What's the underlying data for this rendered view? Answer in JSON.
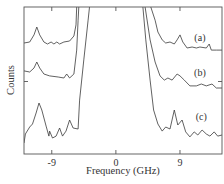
{
  "chart_data": {
    "type": "line",
    "title": "",
    "xlabel": "Frequency (GHz)",
    "ylabel": "Counts",
    "xlim": [
      -12.9,
      14.9
    ],
    "ylim": [
      0,
      100
    ],
    "xticks": [
      -9,
      0,
      9
    ],
    "xtick_labels": [
      "-9",
      "0",
      "9"
    ],
    "yticks": [
      50
    ],
    "ytick_labels": [
      ""
    ],
    "grid": false,
    "legend": "inline labels at right",
    "series": [
      {
        "name": "(a)",
        "label_pos": [
          11.8,
          79
        ],
        "segments": [
          [
            [
              -12.9,
              75.5
            ],
            [
              -12.1,
              76.2
            ],
            [
              -11.5,
              81
            ],
            [
              -11.1,
              86.4
            ],
            [
              -10.7,
              81
            ],
            [
              -10.1,
              76.2
            ],
            [
              -9.6,
              74.8
            ],
            [
              -9.1,
              76.2
            ],
            [
              -8.7,
              74.8
            ],
            [
              -8.3,
              76.2
            ],
            [
              -7.9,
              74.8
            ],
            [
              -7.3,
              76.2
            ],
            [
              -6.5,
              76.9
            ],
            [
              -5.9,
              80.3
            ],
            [
              -5.6,
              87.8
            ],
            [
              -5.5,
              100
            ]
          ],
          [
            [
              4.9,
              100
            ],
            [
              5.5,
              91
            ],
            [
              5.9,
              83
            ],
            [
              6.5,
              77.6
            ],
            [
              7.0,
              75.5
            ],
            [
              7.6,
              76.2
            ],
            [
              8.2,
              74.8
            ],
            [
              8.6,
              77.6
            ],
            [
              9.0,
              81
            ],
            [
              9.4,
              76.2
            ],
            [
              10.0,
              72.1
            ],
            [
              10.7,
              72.8
            ],
            [
              11.3,
              72.1
            ],
            [
              11.8,
              72.8
            ],
            [
              12.7,
              72.1
            ],
            [
              13.1,
              74.8
            ],
            [
              13.4,
              70.7
            ],
            [
              14.1,
              70.7
            ],
            [
              14.9,
              70.7
            ]
          ]
        ]
      },
      {
        "name": "(b)",
        "label_pos": [
          11.8,
          55
        ],
        "segments": [
          [
            [
              -12.9,
              56.5
            ],
            [
              -12.1,
              55.8
            ],
            [
              -11.5,
              58.5
            ],
            [
              -11.1,
              62.6
            ],
            [
              -10.7,
              58.5
            ],
            [
              -10.1,
              54.4
            ],
            [
              -9.3,
              53.1
            ],
            [
              -8.1,
              52.4
            ],
            [
              -7.3,
              51.7
            ],
            [
              -6.9,
              54.4
            ],
            [
              -6.5,
              51.7
            ],
            [
              -5.9,
              54.4
            ],
            [
              -5.5,
              70.7
            ],
            [
              -5.3,
              91
            ],
            [
              -5.2,
              100
            ]
          ],
          [
            [
              4.1,
              100
            ],
            [
              4.8,
              77.6
            ],
            [
              5.5,
              62.6
            ],
            [
              6.2,
              53.1
            ],
            [
              6.8,
              50.3
            ],
            [
              7.3,
              51.7
            ],
            [
              7.9,
              50.3
            ],
            [
              8.6,
              54.4
            ],
            [
              9.0,
              53.1
            ],
            [
              9.6,
              50.3
            ],
            [
              10.4,
              46.3
            ],
            [
              11.3,
              46.3
            ],
            [
              12.0,
              47.6
            ],
            [
              12.7,
              46.3
            ],
            [
              13.5,
              47.6
            ],
            [
              14.1,
              44.9
            ],
            [
              14.9,
              44.9
            ]
          ]
        ]
      },
      {
        "name": "(c)",
        "label_pos": [
          12.0,
          25
        ],
        "segments": [
          [
            [
              -12.9,
              7.5
            ],
            [
              -12.7,
              13.6
            ],
            [
              -12.1,
              18.4
            ],
            [
              -11.7,
              20.4
            ],
            [
              -11.2,
              27.9
            ],
            [
              -10.8,
              34.7
            ],
            [
              -10.4,
              29.9
            ],
            [
              -9.8,
              19
            ],
            [
              -9.4,
              12.2
            ],
            [
              -9.3,
              15.6
            ],
            [
              -8.9,
              10.9
            ],
            [
              -8.4,
              12.2
            ],
            [
              -7.9,
              17.7
            ],
            [
              -7.5,
              12.2
            ],
            [
              -7.0,
              15.6
            ],
            [
              -6.5,
              23.1
            ],
            [
              -6.0,
              17.7
            ],
            [
              -5.3,
              17
            ],
            [
              -5.1,
              36.7
            ],
            [
              -4.5,
              64
            ],
            [
              -3.9,
              91
            ],
            [
              -3.7,
              100
            ]
          ],
          [
            [
              3.8,
              100
            ],
            [
              4.2,
              77.6
            ],
            [
              4.8,
              50.3
            ],
            [
              5.3,
              29.9
            ],
            [
              5.9,
              20.4
            ],
            [
              6.5,
              15.6
            ],
            [
              7.0,
              18.4
            ],
            [
              7.6,
              17
            ],
            [
              8.2,
              29.9
            ],
            [
              8.7,
              19.7
            ],
            [
              9.3,
              23.1
            ],
            [
              9.8,
              15
            ],
            [
              10.4,
              11.6
            ],
            [
              11.0,
              15
            ],
            [
              11.5,
              12.9
            ],
            [
              12.1,
              16.3
            ],
            [
              12.7,
              13.6
            ],
            [
              13.2,
              12.2
            ],
            [
              13.8,
              15
            ],
            [
              14.3,
              12.2
            ],
            [
              14.9,
              12.9
            ]
          ]
        ]
      }
    ]
  }
}
